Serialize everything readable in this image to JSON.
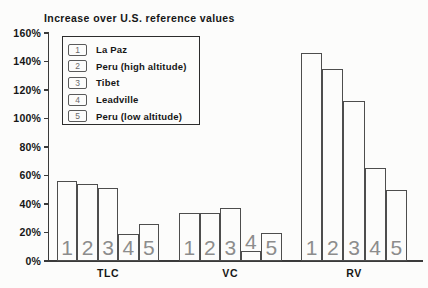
{
  "title": "Increase over U.S. reference values",
  "chart_data": {
    "type": "bar",
    "title": "Increase over U.S. reference values",
    "ylabel": "Increase over U.S. reference values",
    "unit": "%",
    "ylim": [
      0,
      160
    ],
    "ytick_step": 20,
    "ytick_labels": [
      "0%",
      "20%",
      "40%",
      "60%",
      "80%",
      "100%",
      "120%",
      "140%",
      "160%"
    ],
    "grid": false,
    "legend_position": "upper-left-inside",
    "categories": [
      "TLC",
      "VC",
      "RV"
    ],
    "bar_number_labels": [
      "1",
      "2",
      "3",
      "4",
      "5"
    ],
    "series": [
      {
        "key": "1",
        "name": "La Paz",
        "values": [
          56,
          34,
          146
        ]
      },
      {
        "key": "2",
        "name": "Peru (high altitude)",
        "values": [
          54,
          34,
          135
        ]
      },
      {
        "key": "3",
        "name": "Tibet",
        "values": [
          51,
          37,
          112
        ]
      },
      {
        "key": "4",
        "name": "Leadville",
        "values": [
          19,
          7,
          65
        ]
      },
      {
        "key": "5",
        "name": "Peru (low altitude)",
        "values": [
          26,
          20,
          50
        ]
      }
    ]
  },
  "colors": {
    "background": "#fcfcfb",
    "line": "#4d4d4d",
    "axis": "#3a3a3a",
    "text": "#161616",
    "bar_number": "#8c8c8c"
  }
}
